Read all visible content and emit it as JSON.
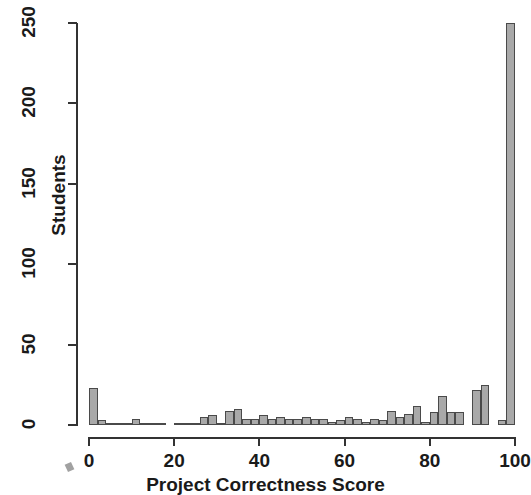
{
  "chart_data": {
    "type": "bar",
    "title": "",
    "subtitle": "",
    "xlabel": "Project Correctness Score",
    "ylabel": "Students",
    "xlim": [
      0,
      100
    ],
    "ylim": [
      0,
      250
    ],
    "grid": false,
    "legend": null,
    "bin_width": 2,
    "x_ticks": [
      0,
      20,
      40,
      60,
      80,
      100
    ],
    "x_tick_labels": [
      "0",
      "20",
      "40",
      "60",
      "80",
      "100"
    ],
    "y_ticks": [
      0,
      50,
      100,
      150,
      200,
      250
    ],
    "y_tick_labels": [
      "0",
      "50",
      "100",
      "150",
      "200",
      "250"
    ],
    "bar_fill_color": "#a9a9a9",
    "bar_edge_color": "#4a4a4a",
    "axis_color": "#333333",
    "background_color": "#ffffff",
    "bin_starts": [
      0,
      2,
      4,
      6,
      8,
      10,
      12,
      14,
      16,
      18,
      20,
      22,
      24,
      26,
      28,
      30,
      32,
      34,
      36,
      38,
      40,
      42,
      44,
      46,
      48,
      50,
      52,
      54,
      56,
      58,
      60,
      62,
      64,
      66,
      68,
      70,
      72,
      74,
      76,
      78,
      80,
      82,
      84,
      86,
      88,
      90,
      92,
      94,
      96,
      98
    ],
    "categories": [
      "0-2",
      "2-4",
      "4-6",
      "6-8",
      "8-10",
      "10-12",
      "12-14",
      "14-16",
      "16-18",
      "18-20",
      "20-22",
      "22-24",
      "24-26",
      "26-28",
      "28-30",
      "30-32",
      "32-34",
      "34-36",
      "36-38",
      "38-40",
      "40-42",
      "42-44",
      "44-46",
      "46-48",
      "48-50",
      "50-52",
      "52-54",
      "54-56",
      "56-58",
      "58-60",
      "60-62",
      "62-64",
      "64-66",
      "66-68",
      "68-70",
      "70-72",
      "72-74",
      "74-76",
      "76-78",
      "78-80",
      "80-82",
      "82-84",
      "84-86",
      "86-88",
      "88-90",
      "90-92",
      "92-94",
      "94-96",
      "96-98",
      "98-100"
    ],
    "values": [
      23,
      3,
      1,
      1,
      1,
      4,
      1,
      1,
      1,
      0,
      1,
      1,
      1,
      5,
      6,
      1,
      9,
      10,
      4,
      4,
      6,
      4,
      5,
      4,
      4,
      5,
      4,
      4,
      2,
      3,
      5,
      4,
      2,
      4,
      3,
      9,
      5,
      7,
      12,
      2,
      8,
      18,
      8,
      8,
      0,
      22,
      25,
      0,
      3,
      250
    ],
    "annotations": []
  },
  "axes": {
    "y_title": "Students",
    "x_title": "Project Correctness Score"
  }
}
